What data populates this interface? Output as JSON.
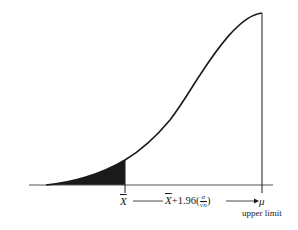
{
  "diagram": {
    "type": "one-sided confidence bound on sampling distribution",
    "colors": {
      "curve": "#1a1a1a",
      "shade": "#1a1a1a",
      "axis": "#555555",
      "background": "#ffffff"
    },
    "labels": {
      "xbar": "X",
      "formula_prefix": "X",
      "formula_mid": "+1.96(",
      "frac_num": "σ",
      "frac_den": "√n",
      "formula_suffix": ")",
      "mu": "μ",
      "upper_limit": "upper limit"
    },
    "icons": {
      "arrow": "arrow-right-icon"
    }
  }
}
